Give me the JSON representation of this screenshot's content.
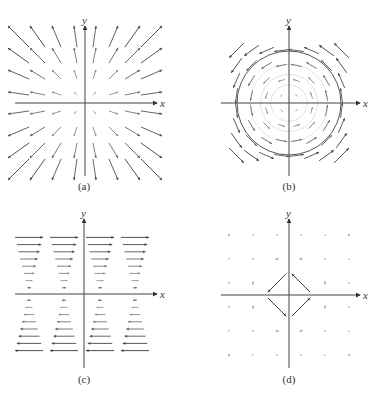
{
  "colors": {
    "axis": "#444444",
    "arrow_dark": "#3c3c3c",
    "arrow_light": "#b8b8b8",
    "circle": "#555555",
    "background": "#ffffff"
  },
  "panels": [
    {
      "id": "a",
      "caption": "(a)",
      "x_label": "x",
      "y_label": "y",
      "field": "radial",
      "description": "Vector field F(x,y) = <x, y>, arrows pointing away from origin, length proportional to distance",
      "origin": [
        85,
        103
      ],
      "x_axis": [
        15,
        157
      ],
      "y_axis": [
        26,
        176
      ],
      "caption_pos": [
        84,
        190
      ],
      "grid": [
        -3.5,
        -2.5,
        -1.5,
        -0.5,
        0.5,
        1.5,
        2.5,
        3.5
      ],
      "spacing": 19,
      "scale": 0.32
    },
    {
      "id": "b",
      "caption": "(b)",
      "x_label": "x",
      "y_label": "y",
      "field": "rotation",
      "description": "Vector field F(x,y) = <-y, x>, counterclockwise circulation with concentric circles",
      "origin": [
        289,
        103
      ],
      "x_axis": [
        221,
        360
      ],
      "y_axis": [
        26,
        176
      ],
      "caption_pos": [
        289,
        190
      ],
      "grid": [
        -3.5,
        -2.5,
        -1.5,
        -0.5,
        0.5,
        1.5,
        2.5,
        3.5
      ],
      "spacing": 15,
      "scale": 0.28,
      "circle_radius": 52
    },
    {
      "id": "c",
      "caption": "(c)",
      "x_label": "x",
      "y_label": "y",
      "field": "shear",
      "description": "Vector field F(x,y) = <y, 0>, horizontal arrows, rightward above x-axis, leftward below, length grows with |y|",
      "origin": [
        84,
        294
      ],
      "x_axis": [
        15,
        157
      ],
      "y_axis": [
        219,
        368
      ],
      "caption_pos": [
        84,
        383
      ],
      "columns": [
        29,
        64,
        100,
        135
      ],
      "rows": [
        1,
        2,
        3,
        4,
        5,
        6,
        7,
        8
      ],
      "row_spacing": 7.2,
      "max_length": 28
    },
    {
      "id": "d",
      "caption": "(d)",
      "x_label": "x",
      "y_label": "y",
      "field": "decaying-rotation",
      "description": "Vector field with large counterclockwise arrows near origin that decay rapidly with distance",
      "origin": [
        289,
        295
      ],
      "x_axis": [
        221,
        360
      ],
      "y_axis": [
        219,
        368
      ],
      "caption_pos": [
        289,
        383
      ],
      "grid": [
        -2.5,
        -1.5,
        -0.5,
        0.5,
        1.5,
        2.5
      ],
      "spacing": 24
    }
  ]
}
